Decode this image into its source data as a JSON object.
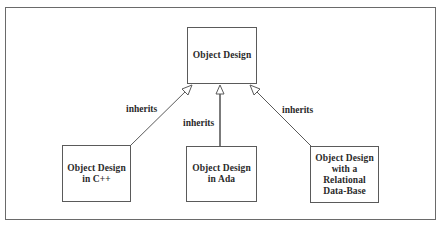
{
  "diagram": {
    "type": "class-inheritance",
    "parent": {
      "label": "Object Design"
    },
    "children": [
      {
        "label": "Object Design\nin C++"
      },
      {
        "label": "Object Design\nin Ada"
      },
      {
        "label": "Object Design\nwith a\nRelational\nData-Base"
      }
    ],
    "edges": [
      {
        "from": "Object Design in C++",
        "to": "Object Design",
        "label": "inherits",
        "arrow": "hollow-triangle"
      },
      {
        "from": "Object Design in Ada",
        "to": "Object Design",
        "label": "inherits",
        "arrow": "hollow-triangle"
      },
      {
        "from": "Object Design with a Relational Data-Base",
        "to": "Object Design",
        "label": "inherits",
        "arrow": "hollow-triangle"
      }
    ]
  },
  "colors": {
    "line": "#5a5a5a",
    "text": "#2a2a2a",
    "background": "#ffffff"
  }
}
